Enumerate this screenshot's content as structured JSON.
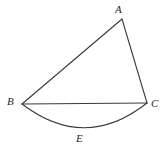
{
  "figure": {
    "background_color": "#ffffff",
    "stroke_color": "#3a3a3a",
    "label_color": "#262626",
    "stroke_width": 1.1,
    "width": 167,
    "height": 160,
    "points": {
      "A": {
        "label": "A",
        "x": 122,
        "y": 19,
        "label_x": 115,
        "label_y": 4
      },
      "B": {
        "label": "B",
        "x": 22,
        "y": 104,
        "label_x": 7,
        "label_y": 96
      },
      "C": {
        "label": "C",
        "x": 147,
        "y": 103,
        "label_x": 151,
        "label_y": 98
      },
      "E": {
        "label": "E",
        "x": 85,
        "y": 131,
        "label_x": 76,
        "label_y": 133
      }
    },
    "segments": [
      {
        "name": "side-BA",
        "from": "B",
        "to": "A",
        "path": "M 22 104 L 122 19"
      },
      {
        "name": "side-AC",
        "from": "A",
        "to": "C",
        "path": "M 122 19 L 147 103"
      },
      {
        "name": "side-BC",
        "from": "B",
        "to": "C",
        "path": "M 22 104 L 147 103"
      }
    ],
    "arcs": [
      {
        "name": "arc-BEC",
        "from": "B",
        "through": "E",
        "to": "C",
        "path": "M 22 104 Q 85 152 147 103"
      }
    ]
  }
}
